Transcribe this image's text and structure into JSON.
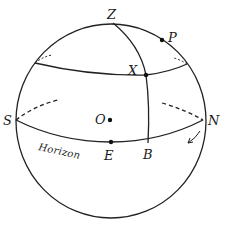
{
  "diagram": {
    "labels": {
      "zenith": "Z",
      "pole": "P",
      "star": "X",
      "south": "S",
      "north": "N",
      "center": "O",
      "east": "E",
      "foot_of_vertical": "B",
      "horizon": "Horizon"
    },
    "colors": {
      "line": "#222222",
      "background": "#ffffff"
    }
  }
}
